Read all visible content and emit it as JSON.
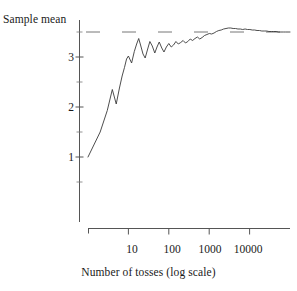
{
  "chart_data": {
    "type": "line",
    "title": "",
    "subtitle": "",
    "xlabel": "Number of tosses (log scale)",
    "ylabel": "Sample mean",
    "xscale": "log",
    "yscale": "linear",
    "xlim": [
      1,
      100000
    ],
    "ylim": [
      0.3,
      3.85
    ],
    "grid": false,
    "legend": null,
    "xticks": [
      10,
      100,
      1000,
      10000
    ],
    "xtick_labels": [
      "10",
      "100",
      "1000",
      "10000"
    ],
    "yticks": [
      1,
      2,
      3
    ],
    "ytick_labels": [
      "1",
      "2",
      "3"
    ],
    "yticks_minor": [
      0.5,
      1.5,
      2.5,
      3.5
    ],
    "annotations": [
      {
        "name": "expected-value-reference-line",
        "style": "dashed",
        "orientation": "horizontal",
        "y": 3.5,
        "label": ""
      }
    ],
    "series": [
      {
        "name": "Running sample mean of die tosses",
        "color": "#3a3a3a",
        "x": [
          1,
          2,
          3,
          4,
          5,
          6,
          7,
          8,
          9,
          10,
          12,
          14,
          16,
          18,
          20,
          23,
          26,
          30,
          34,
          39,
          45,
          51,
          58,
          67,
          76,
          87,
          100,
          115,
          131,
          150,
          172,
          197,
          226,
          259,
          296,
          339,
          388,
          445,
          510,
          584,
          669,
          766,
          878,
          1006,
          1152,
          1320,
          1512,
          1732,
          1985,
          2274,
          2605,
          2984,
          3419,
          3917,
          4488,
          5141,
          5890,
          6748,
          7732,
          8859,
          10150,
          11628,
          13322,
          15264,
          17489,
          20037,
          22956,
          26300,
          30130,
          34518,
          39546,
          45310,
          51918,
          59494,
          68179,
          78134,
          89537,
          100000
        ],
        "y": [
          1.0,
          1.5,
          1.93,
          2.35,
          2.06,
          2.38,
          2.62,
          2.79,
          2.96,
          3.02,
          2.88,
          3.11,
          3.26,
          3.37,
          3.24,
          3.06,
          2.98,
          3.16,
          3.31,
          3.22,
          3.08,
          3.2,
          3.3,
          3.18,
          3.1,
          3.2,
          3.27,
          3.2,
          3.24,
          3.31,
          3.26,
          3.29,
          3.33,
          3.28,
          3.31,
          3.36,
          3.33,
          3.37,
          3.4,
          3.36,
          3.39,
          3.43,
          3.45,
          3.47,
          3.46,
          3.48,
          3.51,
          3.53,
          3.54,
          3.56,
          3.57,
          3.58,
          3.58,
          3.57,
          3.57,
          3.56,
          3.56,
          3.55,
          3.56,
          3.55,
          3.55,
          3.54,
          3.54,
          3.53,
          3.53,
          3.52,
          3.52,
          3.52,
          3.51,
          3.51,
          3.51,
          3.51,
          3.5,
          3.5,
          3.5,
          3.5,
          3.5,
          3.5
        ]
      }
    ]
  },
  "axes": {
    "y_title": "Sample mean",
    "x_title": "Number of tosses (log scale)",
    "y_labels": [
      "3",
      "2",
      "1"
    ],
    "x_labels": [
      "10",
      "100",
      "1000",
      "10000"
    ]
  }
}
